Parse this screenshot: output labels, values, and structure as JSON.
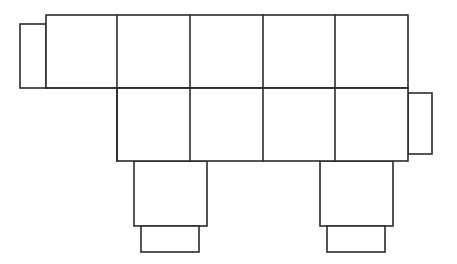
{
  "figure": {
    "kind": "geometric-net-line-drawing",
    "canvas": {
      "width": 457,
      "height": 264,
      "background": "#ffffff"
    },
    "stroke": {
      "color": "#2b2b2b",
      "width": 1.6
    },
    "fill": "#ffffff"
  },
  "geometry": {
    "grid": {
      "label": "main-rectangle-grid",
      "x_divisions": [
        46,
        117,
        190,
        263,
        335,
        408
      ],
      "y_divisions": [
        15,
        88,
        161
      ],
      "top_row": {
        "x_start": 46,
        "x_end": 408,
        "y_top": 15,
        "y_bottom": 88,
        "cells": 5
      },
      "bottom_row": {
        "x_start": 117,
        "x_end": 408,
        "y_top": 88,
        "y_bottom": 161,
        "cells": 4
      }
    },
    "tabs": [
      {
        "name": "left-tab",
        "x": 20,
        "y": 24,
        "width": 26,
        "height": 64
      },
      {
        "name": "right-tab",
        "x": 408,
        "y": 93,
        "width": 24,
        "height": 61
      }
    ],
    "legs": [
      {
        "name": "left-leg",
        "upper": {
          "x": 134,
          "y": 161,
          "width": 73,
          "height": 65
        },
        "lower": {
          "x": 141,
          "y": 226,
          "width": 58,
          "height": 26
        }
      },
      {
        "name": "right-leg",
        "upper": {
          "x": 320,
          "y": 161,
          "width": 73,
          "height": 65
        },
        "lower": {
          "x": 327,
          "y": 226,
          "width": 58,
          "height": 26
        }
      }
    ]
  },
  "chart_data": {
    "type": "table",
    "xlabel": "",
    "ylabel": "",
    "categories": [
      "top-row-cell-1",
      "top-row-cell-2",
      "top-row-cell-3",
      "top-row-cell-4",
      "top-row-cell-5",
      "bottom-row-cell-1",
      "bottom-row-cell-2",
      "bottom-row-cell-3",
      "bottom-row-cell-4",
      "left-tab",
      "right-tab",
      "left-leg-upper",
      "left-leg-lower",
      "right-leg-upper",
      "right-leg-lower"
    ],
    "values": [
      73,
      73,
      73,
      72,
      73,
      73,
      73,
      72,
      73,
      26,
      24,
      73,
      58,
      73,
      58
    ],
    "series": [
      {
        "name": "width_px",
        "values": [
          71,
          73,
          73,
          72,
          73,
          73,
          73,
          72,
          73,
          26,
          24,
          73,
          58,
          73,
          58
        ]
      },
      {
        "name": "height_px",
        "values": [
          73,
          73,
          73,
          73,
          73,
          73,
          73,
          73,
          73,
          64,
          61,
          65,
          26,
          65,
          26
        ]
      }
    ]
  }
}
